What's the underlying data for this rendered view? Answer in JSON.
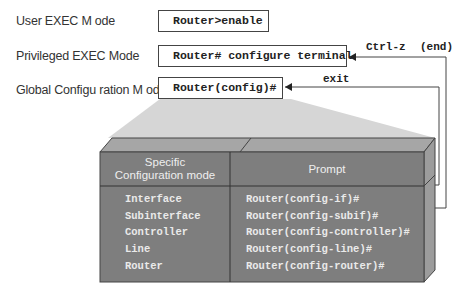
{
  "modes": [
    {
      "label": "User EXEC M ode",
      "command": "Router>enable"
    },
    {
      "label": "Privileged EXEC Mode",
      "command": "Router# configure terminal"
    },
    {
      "label": "Global Configu ration M ode",
      "command": "Router(config)#"
    }
  ],
  "arrows": {
    "ctrl_z": "Ctrl-z",
    "end": "(end)",
    "exit": "exit"
  },
  "table": {
    "headers": {
      "mode": [
        "Specific",
        "Configuration mode"
      ],
      "prompt": "Prompt"
    },
    "rows": [
      {
        "mode": "Interface",
        "prompt": "Router(config-if)#"
      },
      {
        "mode": "Subinterface",
        "prompt": "Router(config-subif)#"
      },
      {
        "mode": "Controller",
        "prompt": "Router(config-controller)#"
      },
      {
        "mode": "Line",
        "prompt": "Router(config-line)#"
      },
      {
        "mode": "Router",
        "prompt": "Router(config-router)#"
      }
    ]
  },
  "colors": {
    "table_front": "#7f7f7f",
    "table_top": "#a9a9a9",
    "table_side": "#9a9a9a",
    "projection": "#d4d4d4",
    "border": "#444444"
  }
}
